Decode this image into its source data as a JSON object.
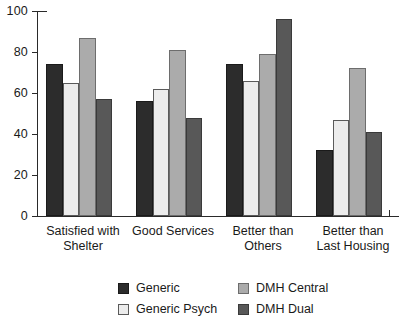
{
  "chart_data": {
    "type": "bar",
    "title": "",
    "subtitle": "",
    "xlabel": "",
    "ylabel": "",
    "ylim": [
      0,
      100
    ],
    "yticks": [
      0,
      20,
      40,
      60,
      80,
      100
    ],
    "ytick_labels": [
      "0",
      "20",
      "40",
      "60",
      "80",
      "100"
    ],
    "grid": false,
    "legend_position": "bottom",
    "categories": [
      "Satisfied with Shelter",
      "Good Services",
      "Better than Others",
      "Better than Last Housing"
    ],
    "category_lines": [
      [
        "Satisfied with",
        "Shelter"
      ],
      [
        "Good Services",
        ""
      ],
      [
        "Better than",
        "Others"
      ],
      [
        "Better than",
        "Last Housing"
      ]
    ],
    "series": [
      {
        "name": "Generic",
        "color": "#2c2c2c",
        "values": [
          74,
          56,
          74,
          32
        ]
      },
      {
        "name": "Generic Psych",
        "color": "#ececec",
        "values": [
          65,
          62,
          66,
          47
        ]
      },
      {
        "name": "DMH Central",
        "color": "#ababab",
        "values": [
          87,
          81,
          79,
          72
        ]
      },
      {
        "name": "DMH Dual",
        "color": "#585858",
        "values": [
          57,
          48,
          96,
          41
        ]
      }
    ]
  },
  "legend": {
    "entries": [
      {
        "label": "Generic"
      },
      {
        "label": "Generic Psych"
      },
      {
        "label": "DMH Central"
      },
      {
        "label": "DMH Dual"
      }
    ]
  }
}
